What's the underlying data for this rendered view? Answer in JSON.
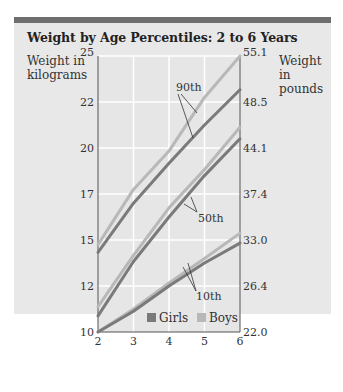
{
  "chart_data": {
    "type": "line",
    "title": "Weight by Age Percentiles: 2 to 6 Years",
    "xlabel": "Age in years",
    "ylabel_left": "Weight in kilograms",
    "ylabel_right": "Weight in pounds",
    "x": [
      2,
      3,
      4,
      5,
      6
    ],
    "xlim": [
      2,
      6
    ],
    "ylim": [
      10,
      25
    ],
    "y_ticks_left": [
      25,
      22,
      20,
      17,
      15,
      12,
      10
    ],
    "y_ticks_right": [
      "55.1",
      "48.5",
      "44.1",
      "37.4",
      "33.0",
      "26.4",
      "22.0"
    ],
    "x_ticks": [
      "2",
      "3",
      "4",
      "5",
      "6"
    ],
    "grid": true,
    "legend": {
      "position": "bottom-right-inside",
      "entries": [
        "Girls",
        "Boys"
      ]
    },
    "annotations": [
      "90th",
      "50th",
      "10th"
    ],
    "series": [
      {
        "name": "Boys 90th",
        "group": "Boys",
        "percentile": "90th",
        "values": [
          14.7,
          17.3,
          19.8,
          22.3,
          25.0
        ]
      },
      {
        "name": "Girls 90th",
        "group": "Girls",
        "percentile": "90th",
        "values": [
          14.2,
          16.6,
          19.0,
          21.0,
          22.8
        ]
      },
      {
        "name": "Boys 50th",
        "group": "Boys",
        "percentile": "50th",
        "values": [
          11.1,
          14.0,
          16.4,
          18.6,
          20.9
        ]
      },
      {
        "name": "Girls 50th",
        "group": "Girls",
        "percentile": "50th",
        "values": [
          10.7,
          13.6,
          16.0,
          18.2,
          20.4
        ]
      },
      {
        "name": "Boys 10th",
        "group": "Boys",
        "percentile": "10th",
        "values": [
          10.0,
          11.0,
          12.2,
          13.8,
          15.3
        ]
      },
      {
        "name": "Girls 10th",
        "group": "Girls",
        "percentile": "10th",
        "values": [
          10.0,
          10.9,
          12.0,
          13.5,
          14.8
        ]
      }
    ],
    "colors": {
      "Girls": "#7a7a7a",
      "Boys": "#b8b8b8"
    }
  }
}
